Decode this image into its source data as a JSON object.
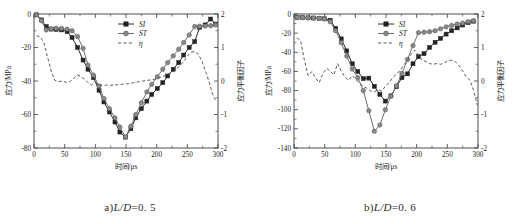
{
  "figure": {
    "panels": [
      {
        "id": "panel-a",
        "caption_prefix": "a)",
        "caption_expr": "L/D",
        "caption_value": "=0. 5",
        "chart_data": {
          "type": "line",
          "title": "",
          "xlabel": "时间/μs",
          "ylabel": "应力/MPa",
          "y2label": "应力平衡因子",
          "xlim": [
            0,
            300
          ],
          "ylim": [
            -80,
            0
          ],
          "y2lim": [
            -2,
            2
          ],
          "xticks": [
            0,
            50,
            100,
            150,
            200,
            250,
            300
          ],
          "yticks": [
            0,
            -20,
            -40,
            -60,
            -80
          ],
          "y2ticks": [
            2,
            1,
            0,
            -1,
            -2
          ],
          "grid": false,
          "legend_position": "top-center",
          "series": [
            {
              "name": "SI",
              "axis": "left",
              "marker": "square",
              "color": "#232323",
              "x": [
                4,
                12,
                20,
                28,
                36,
                45,
                54,
                62,
                71,
                80,
                88,
                97,
                106,
                114,
                123,
                132,
                140,
                149,
                158,
                166,
                175,
                184,
                192,
                201,
                210,
                218,
                227,
                236,
                244,
                253,
                262,
                270,
                279,
                288,
                296
              ],
              "y": [
                -0.5,
                -3.5,
                -7.5,
                -9.0,
                -9.2,
                -9.5,
                -10.5,
                -14.0,
                -20.0,
                -27.5,
                -33.0,
                -38.0,
                -45.5,
                -52.5,
                -58.5,
                -64.5,
                -70.5,
                -73.5,
                -68.5,
                -62.0,
                -56.5,
                -52.0,
                -48.0,
                -44.5,
                -41.0,
                -37.0,
                -33.0,
                -29.0,
                -24.5,
                -20.0,
                -16.5,
                -8.0,
                -6.5,
                -3.0,
                -6.0
              ]
            },
            {
              "name": "ST",
              "axis": "left",
              "marker": "circle",
              "color": "#8a8a8a",
              "x": [
                4,
                12,
                20,
                28,
                36,
                45,
                54,
                62,
                71,
                80,
                88,
                97,
                106,
                114,
                123,
                132,
                140,
                149,
                158,
                166,
                175,
                184,
                192,
                201,
                210,
                218,
                227,
                236,
                244,
                253,
                262,
                270,
                279,
                288,
                296
              ],
              "y": [
                -0.5,
                -4.0,
                -9.5,
                -8.8,
                -8.5,
                -8.6,
                -9.0,
                -10.0,
                -13.5,
                -20.5,
                -30.5,
                -36.5,
                -43.0,
                -50.5,
                -56.5,
                -62.0,
                -67.5,
                -73.5,
                -67.0,
                -60.0,
                -53.0,
                -46.5,
                -42.0,
                -37.5,
                -33.0,
                -29.0,
                -25.0,
                -21.0,
                -17.0,
                -12.5,
                -7.5,
                -7.3,
                -7.2,
                -7.0,
                -6.5
              ]
            },
            {
              "name": "η",
              "axis": "right",
              "marker": "none",
              "color": "#4a4a4a",
              "x": [
                4,
                10,
                16,
                22,
                28,
                34,
                40,
                46,
                52,
                58,
                64,
                70,
                76,
                82,
                88,
                94,
                100,
                106,
                112,
                118,
                124,
                130,
                136,
                142,
                148,
                154,
                160,
                166,
                172,
                178,
                184,
                190,
                196,
                202,
                208,
                214,
                220,
                226,
                232,
                238,
                244,
                250,
                256,
                262,
                268,
                274,
                280,
                286,
                292,
                298
              ],
              "y": [
                1.35,
                1.32,
                1.15,
                0.72,
                0.3,
                0.02,
                -0.02,
                0.0,
                -0.04,
                -0.02,
                0.06,
                0.18,
                0.14,
                0.06,
                -0.05,
                -0.12,
                -0.04,
                -0.1,
                -0.14,
                -0.12,
                -0.13,
                -0.12,
                -0.11,
                -0.1,
                -0.09,
                -0.08,
                -0.06,
                -0.04,
                -0.02,
                0.0,
                0.02,
                0.03,
                0.05,
                0.08,
                0.12,
                0.16,
                0.22,
                0.28,
                0.36,
                0.46,
                0.58,
                0.74,
                0.86,
                0.88,
                0.8,
                0.58,
                0.28,
                -0.06,
                -0.45,
                -0.62
              ]
            }
          ]
        }
      },
      {
        "id": "panel-b",
        "caption_prefix": "b)",
        "caption_expr": "L/D",
        "caption_value": "=0. 6",
        "chart_data": {
          "type": "line",
          "title": "",
          "xlabel": "时间/μs",
          "ylabel": "应力/MPa",
          "y2label": "应力平衡因子",
          "xlim": [
            0,
            300
          ],
          "ylim": [
            -140,
            0
          ],
          "y2lim": [
            -2,
            2
          ],
          "xticks": [
            0,
            50,
            100,
            150,
            200,
            250,
            300
          ],
          "yticks": [
            0,
            -20,
            -40,
            -60,
            -80,
            -100,
            -120,
            -140
          ],
          "y2ticks": [
            2,
            1,
            0,
            -1,
            -2
          ],
          "grid": false,
          "legend_position": "top-center",
          "series": [
            {
              "name": "SI",
              "axis": "left",
              "marker": "square",
              "color": "#232323",
              "x": [
                5,
                14,
                23,
                32,
                41,
                50,
                59,
                68,
                77,
                86,
                95,
                104,
                113,
                122,
                131,
                140,
                149,
                158,
                167,
                176,
                185,
                194,
                203,
                212,
                221,
                230,
                239,
                248,
                257,
                266,
                275,
                284,
                293
              ],
              "y": [
                -3.5,
                -3.8,
                -4.0,
                -4.2,
                -4.5,
                -5.0,
                -6.5,
                -15.0,
                -26.0,
                -38.5,
                -52.0,
                -60.0,
                -67.5,
                -67.0,
                -75.5,
                -84.0,
                -91.0,
                -85.5,
                -76.0,
                -66.5,
                -62.5,
                -52.0,
                -44.5,
                -41.5,
                -35.0,
                -29.5,
                -25.5,
                -21.0,
                -17.5,
                -14.5,
                -11.5,
                -9.0,
                -7.5
              ]
            },
            {
              "name": "ST",
              "axis": "left",
              "marker": "circle",
              "color": "#8a8a8a",
              "x": [
                5,
                14,
                23,
                32,
                41,
                50,
                59,
                68,
                77,
                86,
                95,
                104,
                113,
                122,
                131,
                140,
                149,
                158,
                167,
                176,
                185,
                194,
                203,
                212,
                221,
                230,
                239,
                248,
                257,
                266,
                275,
                284,
                293
              ],
              "y": [
                -3.5,
                -3.8,
                -4.0,
                -4.2,
                -4.5,
                -5.2,
                -8.0,
                -17.5,
                -30.0,
                -44.0,
                -57.5,
                -66.5,
                -80.0,
                -101.0,
                -122.5,
                -116.0,
                -100.0,
                -86.0,
                -75.0,
                -62.0,
                -47.5,
                -33.0,
                -19.5,
                -19.0,
                -18.5,
                -17.5,
                -15.5,
                -13.5,
                -12.0,
                -10.5,
                -9.5,
                -8.0,
                -7.0
              ]
            },
            {
              "name": "η",
              "axis": "right",
              "marker": "none",
              "color": "#4a4a4a",
              "x": [
                5,
                11,
                17,
                23,
                29,
                35,
                41,
                47,
                53,
                59,
                65,
                71,
                77,
                83,
                89,
                95,
                101,
                107,
                113,
                119,
                125,
                131,
                137,
                143,
                149,
                155,
                161,
                167,
                173,
                179,
                185,
                191,
                197,
                203,
                209,
                215,
                221,
                227,
                233,
                239,
                245,
                251,
                257,
                263,
                269,
                275,
                281,
                287,
                293,
                299
              ],
              "y": [
                1.3,
                1.18,
                0.62,
                0.16,
                0.28,
                0.1,
                -0.05,
                0.22,
                0.38,
                0.3,
                0.18,
                0.52,
                0.3,
                0.12,
                0.02,
                0.16,
                0.05,
                -0.08,
                -0.16,
                -0.22,
                -0.3,
                -0.32,
                -0.26,
                -0.3,
                -0.16,
                -0.05,
                0.1,
                0.2,
                0.32,
                0.48,
                0.62,
                0.8,
                0.92,
                0.78,
                0.62,
                0.58,
                0.52,
                0.5,
                0.52,
                0.5,
                0.54,
                0.6,
                0.62,
                0.58,
                0.46,
                0.3,
                0.12,
                0.02,
                -0.3,
                -0.72
              ]
            }
          ]
        }
      }
    ]
  }
}
